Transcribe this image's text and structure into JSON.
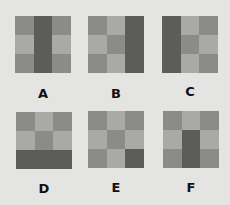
{
  "palette": {
    "background": "#e4e4e2",
    "L": "#a9a9a7",
    "M": "#8b8b89",
    "D": "#5c5c5a"
  },
  "options": [
    {
      "label": "A",
      "cells": [
        [
          "M",
          "D",
          "M"
        ],
        [
          "L",
          "D",
          "L"
        ],
        [
          "M",
          "D",
          "M"
        ]
      ]
    },
    {
      "label": "B",
      "cells": [
        [
          "M",
          "L",
          "D"
        ],
        [
          "L",
          "M",
          "D"
        ],
        [
          "M",
          "L",
          "D"
        ]
      ]
    },
    {
      "label": "C",
      "cells": [
        [
          "D",
          "L",
          "M"
        ],
        [
          "D",
          "M",
          "L"
        ],
        [
          "D",
          "L",
          "M"
        ]
      ]
    },
    {
      "label": "D",
      "cells": [
        [
          "M",
          "L",
          "M"
        ],
        [
          "L",
          "M",
          "L"
        ],
        [
          "D",
          "D",
          "D"
        ]
      ]
    },
    {
      "label": "E",
      "cells": [
        [
          "M",
          "L",
          "M"
        ],
        [
          "L",
          "M",
          "L"
        ],
        [
          "M",
          "L",
          "D"
        ]
      ]
    },
    {
      "label": "F",
      "cells": [
        [
          "M",
          "L",
          "M"
        ],
        [
          "L",
          "D",
          "L"
        ],
        [
          "M",
          "D",
          "M"
        ]
      ]
    }
  ]
}
